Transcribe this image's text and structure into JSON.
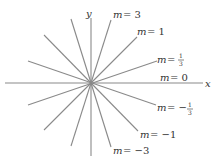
{
  "diagram": {
    "title": "",
    "center": {
      "x": 91,
      "y": 83
    },
    "axes": {
      "x_label": "x",
      "y_label": "y"
    },
    "lines": [
      {
        "slope_label": "m = 3",
        "m": "3",
        "x1": 111,
        "y1": 20,
        "x2": 71,
        "y2": 146
      },
      {
        "slope_label": "m = 1",
        "m": "1",
        "x1": 137,
        "y1": 37,
        "x2": 44,
        "y2": 130
      },
      {
        "slope_label": "m = 1/3",
        "m": "1/3",
        "x1": 157,
        "y1": 61,
        "x2": 28,
        "y2": 105
      },
      {
        "slope_label": "m = 0",
        "m": "0",
        "x1": 203,
        "y1": 83,
        "x2": 5,
        "y2": 83
      },
      {
        "slope_label": "m = -1/3",
        "m": "-1/3",
        "x1": 156,
        "y1": 105,
        "x2": 28,
        "y2": 61
      },
      {
        "slope_label": "m = -1",
        "m": "-1",
        "x1": 138,
        "y1": 131,
        "x2": 44,
        "y2": 35
      },
      {
        "slope_label": "m = -3",
        "m": "-3",
        "x1": 111,
        "y1": 147,
        "x2": 71,
        "y2": 19
      },
      {
        "slope_label": "vertical (y-axis)",
        "m": "undefined",
        "x1": 91,
        "y1": 18,
        "x2": 91,
        "y2": 156
      }
    ],
    "labels": {
      "m3": {
        "var": "m",
        "eq": "= 3"
      },
      "m1": {
        "var": "m",
        "eq": "= 1"
      },
      "m13": {
        "var": "m",
        "eq": "=",
        "num": "1",
        "den": "3"
      },
      "m0": {
        "var": "m",
        "eq": "= 0"
      },
      "mneg13": {
        "var": "m",
        "eq": "= −",
        "num": "1",
        "den": "3"
      },
      "mneg1": {
        "var": "m",
        "eq": "= −1"
      },
      "mneg3": {
        "var": "m",
        "eq": "= −3"
      }
    },
    "line_color": "#8a8a8a"
  }
}
